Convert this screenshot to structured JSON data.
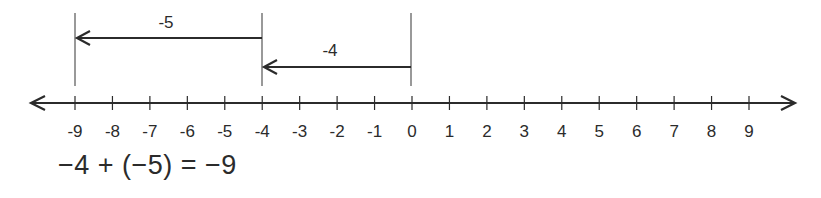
{
  "number_line": {
    "min": -9,
    "max": 9,
    "ticks": [
      "-9",
      "-8",
      "-7",
      "-6",
      "-5",
      "-4",
      "-3",
      "-2",
      "-1",
      "0",
      "1",
      "2",
      "3",
      "4",
      "5",
      "6",
      "7",
      "8",
      "9"
    ],
    "arrows_both_ends": true
  },
  "jumps": [
    {
      "label": "-4",
      "from": 0,
      "to": -4,
      "order": 1
    },
    {
      "label": "-5",
      "from": -4,
      "to": -9,
      "order": 2
    }
  ],
  "equation": "−4 + (−5) = −9",
  "colors": {
    "ink": "#2b2b2b",
    "background": "#ffffff"
  }
}
